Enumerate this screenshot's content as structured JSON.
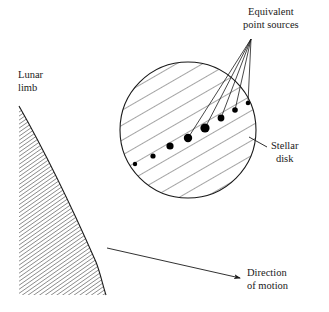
{
  "figure": {
    "background_color": "#ffffff",
    "ink_color": "#1a1a1a",
    "width": 329,
    "height": 312
  },
  "labels": {
    "equivalent_point_sources": "Equivalent\npoint sources",
    "lunar_limb": "Lunar\nlimb",
    "stellar_disk": "Stellar\ndisk",
    "direction_of_motion": "Direction\nof motion"
  },
  "stellar_disk": {
    "shape": "circle",
    "center_x": 188,
    "center_y": 130,
    "radius": 68,
    "fill": "#ffffff",
    "stroke": "#1a1a1a",
    "hatch_angle_deg": 60,
    "hatch_spacing": 13,
    "hatch_count": 11
  },
  "point_sources": {
    "count": 8,
    "fill": "#000000",
    "description": "Equivalent point sources arrayed along a diagonal chord of the stellar disk, sizes peaking near the centre",
    "dots": [
      {
        "index": 1,
        "cx": 135,
        "cy": 164,
        "r": 2.2
      },
      {
        "index": 2,
        "cx": 153,
        "cy": 156,
        "r": 2.6
      },
      {
        "index": 3,
        "cx": 170,
        "cy": 146,
        "r": 3.6
      },
      {
        "index": 4,
        "cx": 188,
        "cy": 138,
        "r": 4.2
      },
      {
        "index": 5,
        "cx": 205,
        "cy": 128,
        "r": 4.6
      },
      {
        "index": 6,
        "cx": 221,
        "cy": 118,
        "r": 3.4
      },
      {
        "index": 7,
        "cx": 235,
        "cy": 110,
        "r": 2.8
      },
      {
        "index": 8,
        "cx": 248,
        "cy": 103,
        "r": 2.3
      }
    ]
  },
  "leader_lines": {
    "convergence_x": 251,
    "convergence_y": 39,
    "targets": [
      4,
      5,
      6,
      7,
      8
    ],
    "stroke": "#1a1a1a"
  },
  "stellar_disk_leader": {
    "from_x": 267,
    "from_y": 147,
    "to_x": 249,
    "to_y": 137
  },
  "lunar_limb": {
    "fill": "#ffffff",
    "stroke": "#1a1a1a",
    "hatch_angle_deg": 55,
    "hatch_spacing": 3.3,
    "top_x": 19,
    "top_y": 106,
    "bottom_x": 106,
    "bottom_y": 295,
    "left_x": 19,
    "description": "Dense diagonally hatched crescent wedge representing the lunar limb"
  },
  "direction_arrow": {
    "from_x": 107,
    "from_y": 248,
    "to_x": 243,
    "to_y": 279,
    "stroke": "#1a1a1a",
    "arrowhead": true
  }
}
